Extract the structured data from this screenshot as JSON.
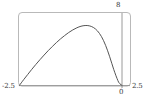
{
  "chart_data": {
    "type": "line",
    "title": "",
    "xlabel": "",
    "ylabel": "",
    "xlim": [
      -2.5,
      2.5
    ],
    "ylim": [
      0,
      8
    ],
    "grid": false,
    "legend": null,
    "frame": true,
    "tick_labels": {
      "x_min": "-2.5",
      "x_zero": "0",
      "x_max": "2.5",
      "y_max": "8"
    },
    "series": [
      {
        "name": "curve",
        "color": "#555555",
        "x": [
          -2.5,
          -2.4,
          -2.3,
          -2.2,
          -2.1,
          -2.0,
          -1.9,
          -1.8,
          -1.7,
          -1.6,
          -1.5,
          -1.4,
          -1.3,
          -1.2,
          -1.1,
          -1.0,
          -0.9,
          -0.8,
          -0.7,
          -0.6,
          -0.5,
          -0.4,
          -0.3,
          -0.2,
          -0.1,
          -0.05,
          0.0
        ],
        "y": [
          0.0,
          0.62,
          1.2,
          1.78,
          2.33,
          2.86,
          3.37,
          3.86,
          4.32,
          4.76,
          5.17,
          5.54,
          5.88,
          6.17,
          6.41,
          6.58,
          6.66,
          6.63,
          6.45,
          6.07,
          5.42,
          4.45,
          3.18,
          1.74,
          0.52,
          0.16,
          0.0
        ]
      }
    ],
    "axis_lines": {
      "baseline_y": 0,
      "vertical_x": 0
    },
    "colors": {
      "frame": "#b9b9b9",
      "axis": "#8f8f8f",
      "curve": "#555555",
      "text": "#3a3a3a",
      "background": "#ffffff"
    }
  }
}
